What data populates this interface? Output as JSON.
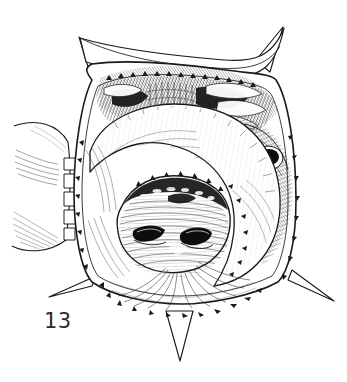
{
  "figure": {
    "label": "13",
    "caption": "",
    "background_color": "#ffffff",
    "ink_color": "#1a1a1a",
    "midtone_color": "#555555",
    "light_tone_color": "#9a9a9a",
    "style": "pen-and-ink line drawing with hatching and stipple shading",
    "width": 347,
    "height": 382
  },
  "structures": [
    {
      "name": "body-outline",
      "description": "rounded square outline of head capsule",
      "bbox": [
        62,
        42,
        248,
        276
      ]
    },
    {
      "name": "spine-upper-left",
      "description": "sharp tapered spine projecting up-left from corner",
      "tip": [
        80,
        38
      ]
    },
    {
      "name": "spine-upper-right",
      "description": "sharp tapered spine projecting up-right from corner",
      "tip": [
        282,
        28
      ]
    },
    {
      "name": "spine-lower-left",
      "description": "sharp tapered spine projecting down-left from corner",
      "tip": [
        50,
        296
      ]
    },
    {
      "name": "spine-lower-right",
      "description": "sharp tapered spine projecting down-right from corner",
      "tip": [
        333,
        300
      ]
    },
    {
      "name": "spine-ventral-median",
      "description": "narrow spine projecting downward at bottom centre",
      "tip": [
        180,
        360
      ]
    },
    {
      "name": "labrum-band",
      "description": "dark transversely-hatched band across the upper oral field",
      "bbox": [
        95,
        75,
        180,
        55
      ]
    },
    {
      "name": "hypostome-lobe",
      "description": "large pale crescent-shaped lobe enclosing the mouth",
      "bbox": [
        88,
        120,
        180,
        130
      ]
    },
    {
      "name": "oral-cavity",
      "description": "central oval cavity with radiating striations",
      "bbox": [
        120,
        185,
        105,
        90
      ]
    },
    {
      "name": "mandible-left",
      "description": "dark solid ovoid sclerite left of midline",
      "bbox": [
        133,
        226,
        32,
        16
      ]
    },
    {
      "name": "mandible-right",
      "description": "dark solid ovoid sclerite right of midline",
      "bbox": [
        180,
        228,
        33,
        17
      ]
    },
    {
      "name": "dark-ocellus",
      "description": "dark ring-shaped spot on the right margin",
      "center": [
        268,
        158
      ]
    },
    {
      "name": "left-appendage",
      "description": "pale limb-like lobe at the left margin with setal fringes",
      "bbox": [
        10,
        120,
        62,
        130
      ]
    },
    {
      "name": "radiating-striations",
      "description": "fan of fine lines spreading from mouth to ventral margin",
      "bbox": [
        105,
        255,
        130,
        60
      ]
    },
    {
      "name": "marginal-denticles",
      "description": "row of small triangular teeth along the inner rim",
      "bbox": [
        80,
        70,
        210,
        250
      ]
    }
  ]
}
